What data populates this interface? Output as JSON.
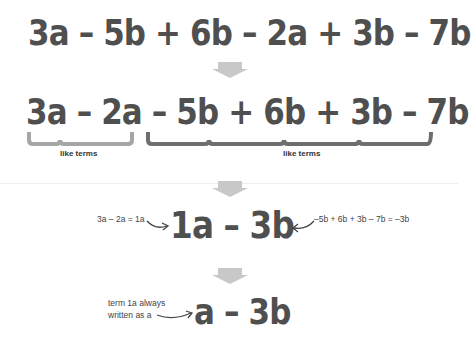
{
  "steps": {
    "step1": {
      "expression": "3a – 5b + 6b – 2a + 3b – 7b"
    },
    "step2": {
      "expression": "3a – 2a  – 5b + 6b + 3b – 7b",
      "group_a_label": "like terms",
      "group_b_label": "like terms"
    },
    "step3": {
      "expression": "1a – 3b",
      "left_note": "3a – 2a = 1a",
      "right_note": "–5b + 6b + 3b – 7b = –3b"
    },
    "step4": {
      "expression": "a – 3b",
      "note_line1": "term 1a always",
      "note_line2": "written as a"
    }
  },
  "colors": {
    "text": "#4f4f4f",
    "arrow": "#c8c8c8",
    "brace_a": "#a6a6a6",
    "brace_b": "#6e6e6e"
  }
}
